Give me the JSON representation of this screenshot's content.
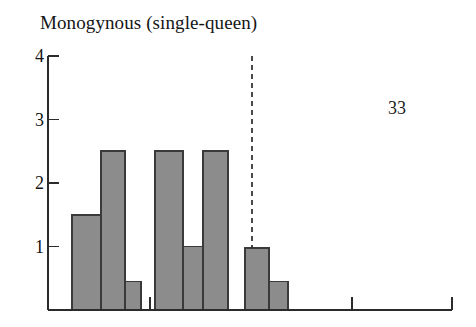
{
  "chart_data": {
    "type": "bar",
    "title": "Monogynous (single-queen)",
    "xlabel": "",
    "ylabel": "",
    "ylim": [
      0,
      4
    ],
    "yticks": [
      1,
      2,
      3,
      4
    ],
    "ytick_labels": [
      "1",
      "2",
      "3",
      "4"
    ],
    "grid": false,
    "legend": null,
    "bar_style": {
      "fill": "#8c8c8c",
      "edge": "#3a3a3a"
    },
    "axis_color": "#2b2b2b",
    "annotations": [
      {
        "name": "count-33",
        "text": "33",
        "x_px": 400,
        "y_value": 3.05
      },
      {
        "name": "threshold-dashed-line",
        "kind": "vline",
        "style": "dashed",
        "x_px": 252,
        "y_from": 0.98,
        "y_to": 4.0,
        "color": "#2b2b2b"
      }
    ],
    "bars": [
      {
        "label": "bin-1",
        "x0_px": 72,
        "x1_px": 101,
        "value": 1.5
      },
      {
        "label": "bin-2",
        "x0_px": 101,
        "x1_px": 125,
        "value": 2.5
      },
      {
        "label": "bin-3",
        "x0_px": 125,
        "x1_px": 141,
        "value": 0.45
      },
      {
        "label": "bin-4",
        "x0_px": 155,
        "x1_px": 183,
        "value": 2.5
      },
      {
        "label": "bin-5",
        "x0_px": 183,
        "x1_px": 203,
        "value": 1.0
      },
      {
        "label": "bin-6",
        "x0_px": 203,
        "x1_px": 228,
        "value": 2.5
      },
      {
        "label": "bin-7",
        "x0_px": 245,
        "x1_px": 269,
        "value": 0.98
      },
      {
        "label": "bin-8",
        "x0_px": 269,
        "x1_px": 288,
        "value": 0.45
      }
    ],
    "x_axis_ticks_px": [
      150,
      352,
      452
    ],
    "values": [
      1.5,
      2.5,
      0.45,
      2.5,
      1.0,
      2.5,
      0.98,
      0.45
    ],
    "categories": [
      "bin-1",
      "bin-2",
      "bin-3",
      "bin-4",
      "bin-5",
      "bin-6",
      "bin-7",
      "bin-8"
    ]
  },
  "geometry": {
    "axis_x_px": 48,
    "baseline_y_px": 310,
    "top_y_px": 56,
    "right_edge_px": 452,
    "unit_px": 63.5
  }
}
